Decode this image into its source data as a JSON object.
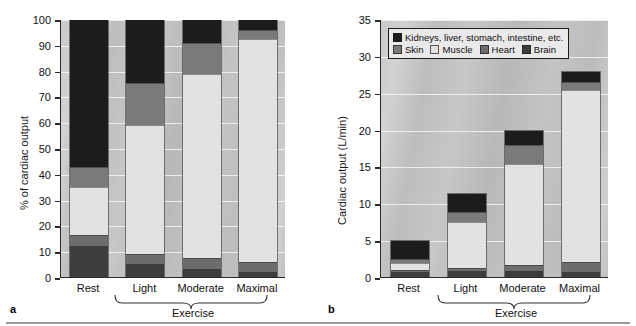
{
  "figure": {
    "panel_a_letter": "a",
    "panel_b_letter": "b"
  },
  "legend": {
    "position": "top-left-inside-panel-b",
    "entries": [
      {
        "label": "Kidneys, liver, stomach, intestine, etc.",
        "color": "#1c1c1c"
      },
      {
        "label": "Skin",
        "color": "#7a7a7a"
      },
      {
        "label": "Muscle",
        "color": "#e2e2e2"
      },
      {
        "label": "Heart",
        "color": "#6d6d6d"
      },
      {
        "label": "Brain",
        "color": "#3d3d3d"
      }
    ]
  },
  "panel_a": {
    "letter": "a",
    "ylabel": "% of cardiac output",
    "group_label": "Exercise",
    "xticklabels": [
      "Rest",
      "Light",
      "Moderate",
      "Maximal"
    ],
    "yticklabels": [
      "0",
      "10",
      "20",
      "30",
      "40",
      "50",
      "60",
      "70",
      "80",
      "90",
      "100"
    ]
  },
  "panel_b": {
    "letter": "b",
    "ylabel": "Cardiac output (L/min)",
    "group_label": "Exercise",
    "xticklabels": [
      "Rest",
      "Light",
      "Moderate",
      "Maximal"
    ],
    "yticklabels": [
      "0",
      "5",
      "10",
      "15",
      "20",
      "25",
      "30",
      "35"
    ]
  },
  "chart_data": [
    {
      "type": "bar",
      "id": "panel-a",
      "subplot_label": "a",
      "stacked": true,
      "title": "",
      "xlabel": "Exercise",
      "ylabel": "% of cardiac output",
      "ylim": [
        0,
        100
      ],
      "ytick_step": 10,
      "yticks": [
        0,
        10,
        20,
        30,
        40,
        50,
        60,
        70,
        80,
        90,
        100
      ],
      "grid": true,
      "categories": [
        "Rest",
        "Light",
        "Moderate",
        "Maximal"
      ],
      "series": [
        {
          "name": "Brain",
          "color": "#3d3d3d",
          "values": [
            12,
            5,
            3,
            2
          ]
        },
        {
          "name": "Heart",
          "color": "#6d6d6d",
          "values": [
            4.5,
            4,
            4.5,
            4
          ]
        },
        {
          "name": "Muscle",
          "color": "#e2e2e2",
          "values": [
            18.5,
            50,
            71.5,
            86.5
          ]
        },
        {
          "name": "Skin",
          "color": "#7a7a7a",
          "values": [
            8,
            16.5,
            12,
            3.5
          ]
        },
        {
          "name": "Kidneys, liver, stomach, intestine, etc.",
          "color": "#1c1c1c",
          "values": [
            57,
            24.5,
            9,
            4
          ]
        }
      ],
      "totals": [
        100,
        100,
        100,
        100
      ]
    },
    {
      "type": "bar",
      "id": "panel-b",
      "subplot_label": "b",
      "stacked": true,
      "title": "",
      "xlabel": "Exercise",
      "ylabel": "Cardiac output (L/min)",
      "ylim": [
        0,
        35
      ],
      "ytick_step": 5,
      "yticks": [
        0,
        5,
        10,
        15,
        20,
        25,
        30,
        35
      ],
      "grid": true,
      "categories": [
        "Rest",
        "Light",
        "Moderate",
        "Maximal"
      ],
      "series": [
        {
          "name": "Brain",
          "color": "#3d3d3d",
          "values": [
            0.75,
            0.85,
            0.85,
            0.75
          ]
        },
        {
          "name": "Heart",
          "color": "#6d6d6d",
          "values": [
            0.25,
            0.35,
            0.75,
            1.25
          ]
        },
        {
          "name": "Muscle",
          "color": "#e2e2e2",
          "values": [
            1.0,
            6.4,
            13.9,
            23.5
          ]
        },
        {
          "name": "Skin",
          "color": "#7a7a7a",
          "values": [
            0.45,
            1.3,
            2.5,
            1.1
          ]
        },
        {
          "name": "Kidneys, liver, stomach, intestine, etc.",
          "color": "#1c1c1c",
          "values": [
            2.55,
            2.5,
            2.0,
            1.4
          ]
        }
      ],
      "totals": [
        5.0,
        11.4,
        20.0,
        28.0
      ]
    }
  ]
}
